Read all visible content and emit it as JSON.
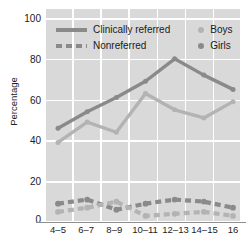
{
  "chart_data": {
    "type": "line",
    "title": "",
    "xlabel": "",
    "ylabel": "Percentage",
    "categories": [
      "4–5",
      "6–7",
      "8–9",
      "10–11",
      "12–13",
      "14–15",
      "16"
    ],
    "ylim": [
      0,
      100
    ],
    "yticks": [
      0,
      20,
      40,
      60,
      80,
      100
    ],
    "ytick_labels": [
      "0",
      "20",
      "40",
      "60",
      "80",
      "100"
    ],
    "grid": true,
    "legend_position": "top-inside",
    "series": [
      {
        "name": "Girls — Clinically referred",
        "group": "Clinically referred",
        "sex": "Girls",
        "style": "solid",
        "color": "#8a8a8a",
        "values": [
          46,
          54,
          61,
          69,
          80,
          72,
          65
        ]
      },
      {
        "name": "Boys — Clinically referred",
        "group": "Clinically referred",
        "sex": "Boys",
        "style": "solid",
        "color": "#b3b3b3",
        "values": [
          39,
          49,
          44,
          63,
          55,
          51,
          59
        ]
      },
      {
        "name": "Girls — Nonreferred",
        "group": "Nonreferred",
        "sex": "Girls",
        "style": "dashed",
        "color": "#8a8a8a",
        "values": [
          9,
          11,
          6,
          9,
          11,
          10,
          7
        ]
      },
      {
        "name": "Boys — Nonreferred",
        "group": "Nonreferred",
        "sex": "Boys",
        "style": "dashed",
        "color": "#b3b3b3",
        "values": [
          5,
          7,
          10,
          3,
          4,
          5,
          3
        ]
      }
    ]
  },
  "legend": {
    "line_styles": [
      {
        "label": "Clinically referred",
        "style": "solid"
      },
      {
        "label": "Nonreferred",
        "style": "dashed"
      }
    ],
    "markers": [
      {
        "label": "Boys",
        "color": "#b3b3b3"
      },
      {
        "label": "Girls",
        "color": "#8a8a8a"
      }
    ]
  },
  "axes": {
    "y_title": "Percentage",
    "y_tick_labels": [
      "100",
      "80",
      "60",
      "40",
      "20",
      "0"
    ],
    "x_tick_labels": [
      "4–5",
      "6–7",
      "8–9",
      "10–11",
      "12–13",
      "14–15",
      "16"
    ]
  },
  "colors": {
    "plot_background": "#d9d9d9",
    "gridline": "#ffffff",
    "dark_series": "#8a8a8a",
    "light_series": "#b3b3b3",
    "text": "#1a1a1a"
  }
}
